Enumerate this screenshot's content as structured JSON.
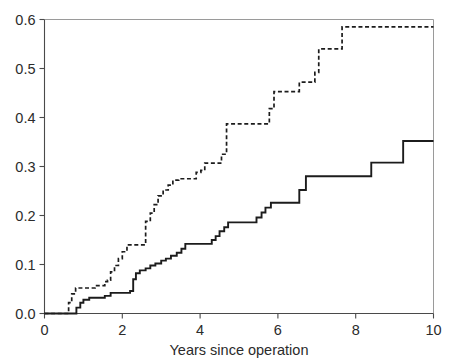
{
  "chart_data": {
    "type": "line",
    "title": "",
    "subtitle": "",
    "xlabel": "Years since operation",
    "ylabel": "",
    "xlim": [
      0,
      10
    ],
    "ylim": [
      0,
      0.6
    ],
    "grid": false,
    "legend_position": "none",
    "xticks": [
      0,
      2,
      4,
      6,
      8,
      10
    ],
    "xtick_labels": [
      "0",
      "2",
      "4",
      "6",
      "8",
      "10"
    ],
    "yticks": [
      0.0,
      0.1,
      0.2,
      0.3,
      0.4,
      0.5,
      0.6
    ],
    "ytick_labels": [
      "0.0",
      "0.1",
      "0.2",
      "0.3",
      "0.4",
      "0.5",
      "0.6"
    ],
    "step_type": "post",
    "series": [
      {
        "name": "dashed-curve",
        "style": "dashed",
        "color": "#1c1c1c",
        "x": [
          0.0,
          0.55,
          0.62,
          0.7,
          0.8,
          1.05,
          1.3,
          1.55,
          1.62,
          1.7,
          1.8,
          1.9,
          2.0,
          2.12,
          2.6,
          2.72,
          2.82,
          2.92,
          3.05,
          3.18,
          3.3,
          3.45,
          3.9,
          4.02,
          4.12,
          4.55,
          4.68,
          5.62,
          5.78,
          5.9,
          6.4,
          6.55,
          6.95,
          7.05,
          7.55,
          7.65,
          10.0
        ],
        "y": [
          0.0,
          0.0,
          0.022,
          0.04,
          0.052,
          0.052,
          0.057,
          0.065,
          0.068,
          0.085,
          0.098,
          0.112,
          0.126,
          0.14,
          0.188,
          0.205,
          0.222,
          0.24,
          0.252,
          0.262,
          0.272,
          0.275,
          0.288,
          0.292,
          0.307,
          0.325,
          0.387,
          0.387,
          0.418,
          0.453,
          0.453,
          0.472,
          0.492,
          0.54,
          0.54,
          0.585,
          0.585
        ]
      },
      {
        "name": "solid-curve",
        "style": "solid",
        "color": "#1c1c1c",
        "x": [
          0.0,
          0.75,
          0.82,
          0.92,
          1.0,
          1.15,
          1.55,
          1.7,
          2.0,
          2.2,
          2.28,
          2.35,
          2.45,
          2.6,
          2.72,
          2.85,
          3.0,
          3.12,
          3.25,
          3.4,
          3.52,
          3.62,
          4.2,
          4.3,
          4.4,
          4.5,
          4.62,
          4.72,
          5.3,
          5.45,
          5.58,
          5.68,
          5.82,
          6.55,
          6.72,
          8.25,
          8.4,
          9.1,
          9.22,
          10.0
        ],
        "y": [
          0.0,
          0.0,
          0.012,
          0.022,
          0.028,
          0.032,
          0.036,
          0.042,
          0.042,
          0.046,
          0.07,
          0.082,
          0.088,
          0.092,
          0.098,
          0.102,
          0.108,
          0.112,
          0.118,
          0.124,
          0.132,
          0.142,
          0.142,
          0.15,
          0.158,
          0.168,
          0.176,
          0.186,
          0.186,
          0.196,
          0.206,
          0.216,
          0.226,
          0.252,
          0.28,
          0.28,
          0.308,
          0.308,
          0.352,
          0.352
        ]
      }
    ]
  },
  "axes": {
    "x_axis_title": "Years since operation"
  },
  "colors": {
    "axis": "#4a4a4a",
    "frame": "#9a9a9a",
    "curve": "#1c1c1c",
    "text": "#2b2b2b",
    "background": "#ffffff"
  }
}
